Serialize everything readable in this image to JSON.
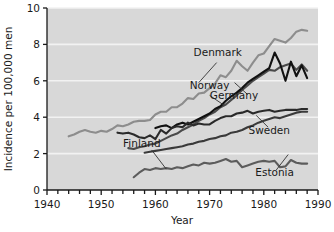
{
  "chart_data": {
    "type": "line",
    "title": "",
    "xlabel": "Year",
    "ylabel": "Incidence per 100,000 men",
    "xlim": [
      1940,
      1990
    ],
    "ylim": [
      0,
      10
    ],
    "xticks_labeled": [
      1940,
      1950,
      1960,
      1970,
      1980,
      1990
    ],
    "xtick_step_minor": 2,
    "yticks": [
      0,
      2,
      4,
      6,
      8,
      10
    ],
    "grid": "horizontal-white",
    "legend": "inline-annotations",
    "plot_background": "#d8d8d8",
    "series": [
      {
        "name": "Denmark",
        "color": "#8d8d8d",
        "label_x": 1971.5,
        "label_y": 7.35,
        "points": [
          [
            1944,
            2.95
          ],
          [
            1945,
            3.05
          ],
          [
            1946,
            3.2
          ],
          [
            1947,
            3.3
          ],
          [
            1948,
            3.2
          ],
          [
            1949,
            3.15
          ],
          [
            1950,
            3.25
          ],
          [
            1951,
            3.2
          ],
          [
            1952,
            3.35
          ],
          [
            1953,
            3.55
          ],
          [
            1954,
            3.5
          ],
          [
            1955,
            3.6
          ],
          [
            1956,
            3.75
          ],
          [
            1957,
            3.8
          ],
          [
            1958,
            3.8
          ],
          [
            1959,
            3.85
          ],
          [
            1960,
            4.15
          ],
          [
            1961,
            4.3
          ],
          [
            1962,
            4.3
          ],
          [
            1963,
            4.55
          ],
          [
            1964,
            4.55
          ],
          [
            1965,
            4.75
          ],
          [
            1966,
            5.05
          ],
          [
            1967,
            5.0
          ],
          [
            1968,
            5.3
          ],
          [
            1969,
            5.35
          ],
          [
            1970,
            5.6
          ],
          [
            1971,
            5.85
          ],
          [
            1972,
            6.3
          ],
          [
            1973,
            6.2
          ],
          [
            1974,
            6.55
          ],
          [
            1975,
            7.1
          ],
          [
            1976,
            6.8
          ],
          [
            1977,
            6.55
          ],
          [
            1978,
            7.0
          ],
          [
            1979,
            7.4
          ],
          [
            1980,
            7.5
          ],
          [
            1981,
            7.9
          ],
          [
            1982,
            8.3
          ],
          [
            1983,
            8.2
          ],
          [
            1984,
            8.1
          ],
          [
            1985,
            8.35
          ],
          [
            1986,
            8.7
          ],
          [
            1987,
            8.8
          ],
          [
            1988,
            8.75
          ]
        ]
      },
      {
        "name": "Norway",
        "color": "#4a4a4a",
        "label_x": 1970.0,
        "label_y": 5.55,
        "points": [
          [
            1955,
            2.3
          ],
          [
            1956,
            2.25
          ],
          [
            1957,
            2.35
          ],
          [
            1958,
            2.4
          ],
          [
            1959,
            2.5
          ],
          [
            1960,
            2.55
          ],
          [
            1961,
            2.7
          ],
          [
            1962,
            2.85
          ],
          [
            1963,
            3.0
          ],
          [
            1964,
            3.1
          ],
          [
            1965,
            3.3
          ],
          [
            1966,
            3.45
          ],
          [
            1967,
            3.6
          ],
          [
            1968,
            3.8
          ],
          [
            1969,
            3.95
          ],
          [
            1970,
            4.15
          ],
          [
            1971,
            4.3
          ],
          [
            1972,
            4.55
          ],
          [
            1973,
            4.7
          ],
          [
            1974,
            4.95
          ],
          [
            1975,
            5.2
          ],
          [
            1976,
            5.5
          ],
          [
            1977,
            5.75
          ],
          [
            1978,
            6.0
          ],
          [
            1979,
            6.2
          ],
          [
            1980,
            6.4
          ],
          [
            1981,
            6.6
          ],
          [
            1982,
            6.55
          ],
          [
            1983,
            6.75
          ],
          [
            1984,
            6.85
          ],
          [
            1985,
            6.95
          ],
          [
            1986,
            6.6
          ],
          [
            1987,
            6.9
          ],
          [
            1988,
            6.55
          ]
        ]
      },
      {
        "name": "Germany",
        "color": "#111111",
        "label_x": 1974.5,
        "label_y": 5.0,
        "points": [
          [
            1960,
            3.4
          ],
          [
            1961,
            3.5
          ],
          [
            1962,
            3.55
          ],
          [
            1963,
            3.4
          ],
          [
            1964,
            3.6
          ],
          [
            1965,
            3.7
          ],
          [
            1966,
            3.6
          ],
          [
            1967,
            3.75
          ],
          [
            1968,
            3.9
          ],
          [
            1969,
            4.05
          ],
          [
            1970,
            4.2
          ],
          [
            1971,
            4.45
          ],
          [
            1972,
            4.6
          ],
          [
            1973,
            4.9
          ],
          [
            1974,
            5.15
          ],
          [
            1975,
            5.35
          ],
          [
            1976,
            5.6
          ],
          [
            1977,
            5.9
          ],
          [
            1978,
            6.1
          ],
          [
            1979,
            6.3
          ],
          [
            1980,
            6.5
          ],
          [
            1981,
            6.7
          ],
          [
            1982,
            7.55
          ],
          [
            1983,
            6.95
          ],
          [
            1984,
            6.0
          ],
          [
            1985,
            7.05
          ],
          [
            1986,
            6.25
          ],
          [
            1987,
            6.85
          ],
          [
            1988,
            6.15
          ]
        ]
      },
      {
        "name": "Finland",
        "color": "#2a2a2a",
        "label_x": 1957.5,
        "label_y": 2.35,
        "points": [
          [
            1953,
            3.15
          ],
          [
            1954,
            3.1
          ],
          [
            1955,
            3.15
          ],
          [
            1956,
            3.05
          ],
          [
            1957,
            2.9
          ],
          [
            1958,
            2.85
          ],
          [
            1959,
            3.0
          ],
          [
            1960,
            2.8
          ],
          [
            1961,
            3.3
          ],
          [
            1962,
            3.1
          ],
          [
            1963,
            3.4
          ],
          [
            1964,
            3.5
          ],
          [
            1965,
            3.45
          ],
          [
            1966,
            3.7
          ],
          [
            1967,
            3.55
          ],
          [
            1968,
            3.65
          ],
          [
            1969,
            3.6
          ],
          [
            1970,
            3.6
          ],
          [
            1971,
            3.8
          ],
          [
            1972,
            3.95
          ],
          [
            1973,
            4.05
          ],
          [
            1974,
            4.05
          ],
          [
            1975,
            4.2
          ],
          [
            1976,
            4.25
          ],
          [
            1977,
            4.35
          ],
          [
            1978,
            4.2
          ],
          [
            1979,
            4.3
          ],
          [
            1980,
            4.35
          ],
          [
            1981,
            4.4
          ],
          [
            1982,
            4.3
          ],
          [
            1983,
            4.35
          ],
          [
            1984,
            4.4
          ],
          [
            1985,
            4.4
          ],
          [
            1986,
            4.4
          ],
          [
            1987,
            4.45
          ],
          [
            1988,
            4.45
          ]
        ]
      },
      {
        "name": "Sweden",
        "color": "#3a3a3a",
        "label_x": 1981.0,
        "label_y": 3.1,
        "points": [
          [
            1958,
            2.05
          ],
          [
            1959,
            2.1
          ],
          [
            1960,
            2.15
          ],
          [
            1961,
            2.2
          ],
          [
            1962,
            2.25
          ],
          [
            1963,
            2.3
          ],
          [
            1964,
            2.35
          ],
          [
            1965,
            2.4
          ],
          [
            1966,
            2.5
          ],
          [
            1967,
            2.55
          ],
          [
            1968,
            2.65
          ],
          [
            1969,
            2.7
          ],
          [
            1970,
            2.8
          ],
          [
            1971,
            2.85
          ],
          [
            1972,
            2.95
          ],
          [
            1973,
            3.0
          ],
          [
            1974,
            3.15
          ],
          [
            1975,
            3.2
          ],
          [
            1976,
            3.3
          ],
          [
            1977,
            3.45
          ],
          [
            1978,
            3.55
          ],
          [
            1979,
            3.7
          ],
          [
            1980,
            3.8
          ],
          [
            1981,
            3.9
          ],
          [
            1982,
            4.0
          ],
          [
            1983,
            3.95
          ],
          [
            1984,
            4.05
          ],
          [
            1985,
            4.15
          ],
          [
            1986,
            4.25
          ],
          [
            1987,
            4.3
          ],
          [
            1988,
            4.3
          ]
        ]
      },
      {
        "name": "Estonia",
        "color": "#5c5c5c",
        "label_x": 1982.0,
        "label_y": 0.75,
        "points": [
          [
            1956,
            0.7
          ],
          [
            1957,
            0.95
          ],
          [
            1958,
            1.15
          ],
          [
            1959,
            1.1
          ],
          [
            1960,
            1.2
          ],
          [
            1961,
            1.15
          ],
          [
            1962,
            1.2
          ],
          [
            1963,
            1.15
          ],
          [
            1964,
            1.25
          ],
          [
            1965,
            1.2
          ],
          [
            1966,
            1.3
          ],
          [
            1967,
            1.4
          ],
          [
            1968,
            1.35
          ],
          [
            1969,
            1.5
          ],
          [
            1970,
            1.45
          ],
          [
            1971,
            1.5
          ],
          [
            1972,
            1.6
          ],
          [
            1973,
            1.7
          ],
          [
            1974,
            1.55
          ],
          [
            1975,
            1.6
          ],
          [
            1976,
            1.25
          ],
          [
            1977,
            1.35
          ],
          [
            1978,
            1.45
          ],
          [
            1979,
            1.55
          ],
          [
            1980,
            1.6
          ],
          [
            1981,
            1.55
          ],
          [
            1982,
            1.6
          ],
          [
            1983,
            1.25
          ],
          [
            1984,
            1.3
          ],
          [
            1985,
            1.65
          ],
          [
            1986,
            1.5
          ],
          [
            1987,
            1.45
          ],
          [
            1988,
            1.45
          ]
        ]
      }
    ],
    "leader_lines": [
      {
        "name": "denmark-leader",
        "from": [
          1971.3,
          7.0
        ],
        "to": [
          1968.0,
          5.9
        ]
      },
      {
        "name": "norway-leader",
        "from": [
          1970.0,
          5.2
        ],
        "to": [
          1972.7,
          4.65
        ]
      },
      {
        "name": "germany-leader",
        "from": [
          1977.0,
          5.25
        ],
        "to": [
          1974.6,
          5.9
        ]
      },
      {
        "name": "finland-leader",
        "from": [
          1959.3,
          2.2
        ],
        "to": [
          1962.0,
          1.15
        ]
      },
      {
        "name": "sweden-leader",
        "from": [
          1980.8,
          3.45
        ],
        "to": [
          1978.6,
          4.1
        ]
      },
      {
        "name": "estonia-leader",
        "from": [
          1982.3,
          1.1
        ],
        "to": [
          1984.5,
          1.95
        ]
      }
    ]
  }
}
